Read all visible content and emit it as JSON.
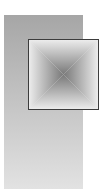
{
  "linear_gradient": {
    "colors": {
      "top": "#a6a6a6",
      "bottom": "#e2e2e2"
    }
  },
  "square_gradient": {
    "colors": {
      "center": "#050505",
      "edge": "#ececec",
      "border": "#3c3c3c"
    }
  }
}
